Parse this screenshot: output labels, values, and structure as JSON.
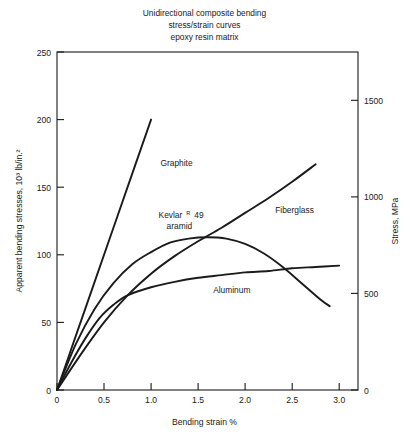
{
  "figure": {
    "title_lines": [
      "Unidirectional composite bending",
      "stress/strain curves",
      "epoxy resin matrix"
    ]
  },
  "chart_data": {
    "type": "line",
    "title": "Unidirectional composite bending stress/strain curves epoxy resin matrix",
    "xlabel": "Bending strain %",
    "ylabel": "Apparent bending stresses, 10³ lb/in.²",
    "ylabel_right": "Stress, MPa",
    "xlim": [
      0,
      3.2
    ],
    "ylim": [
      0,
      250
    ],
    "ylim_right": [
      0,
      1750
    ],
    "grid": false,
    "legend": "inline-annotations",
    "xticks": [
      0,
      0.5,
      1.0,
      1.5,
      2.0,
      2.5,
      3.0
    ],
    "xticklabels": [
      "0",
      "0.5",
      "1.0",
      "1.5",
      "2.0",
      "2.5",
      "3.0"
    ],
    "yticks": [
      0,
      50,
      100,
      150,
      200,
      250
    ],
    "yticklabels": [
      "0",
      "50",
      "100",
      "150",
      "200",
      "250"
    ],
    "yticks_right": [
      0,
      500,
      1000,
      1500
    ],
    "yticklabels_right": [
      "0",
      "500",
      "1000",
      "1500"
    ],
    "series": [
      {
        "name": "Graphite",
        "label": "Graphite",
        "label_x": 1.1,
        "label_y": 166,
        "points": [
          [
            0.0,
            0
          ],
          [
            0.2,
            40
          ],
          [
            0.4,
            80
          ],
          [
            0.6,
            120
          ],
          [
            0.8,
            160
          ],
          [
            1.0,
            200
          ]
        ]
      },
      {
        "name": "Fiberglass",
        "label": "Fiberglass",
        "label_x": 2.32,
        "label_y": 131,
        "points": [
          [
            0.0,
            0
          ],
          [
            0.25,
            26
          ],
          [
            0.5,
            50
          ],
          [
            0.75,
            70
          ],
          [
            1.0,
            86
          ],
          [
            1.25,
            99
          ],
          [
            1.5,
            110
          ],
          [
            1.75,
            120
          ],
          [
            2.0,
            131
          ],
          [
            2.25,
            142
          ],
          [
            2.5,
            154
          ],
          [
            2.75,
            167
          ]
        ]
      },
      {
        "name": "Kevlar R 49 aramid",
        "label": "Kevlar",
        "label_sup": "R",
        "label_num": "49",
        "label_line2": "aramid",
        "label_x": 1.08,
        "label_y": 127,
        "points": [
          [
            0.0,
            0
          ],
          [
            0.2,
            34
          ],
          [
            0.4,
            60
          ],
          [
            0.6,
            79
          ],
          [
            0.8,
            93
          ],
          [
            1.0,
            102
          ],
          [
            1.2,
            109
          ],
          [
            1.4,
            112
          ],
          [
            1.6,
            113
          ],
          [
            1.8,
            112
          ],
          [
            2.0,
            108
          ],
          [
            2.2,
            101
          ],
          [
            2.4,
            91
          ],
          [
            2.6,
            79
          ],
          [
            2.8,
            67
          ],
          [
            2.9,
            62
          ]
        ]
      },
      {
        "name": "Aluminum",
        "label": "Aluminum",
        "label_x": 1.66,
        "label_y": 72,
        "points": [
          [
            0.0,
            0
          ],
          [
            0.15,
            20
          ],
          [
            0.3,
            38
          ],
          [
            0.45,
            53
          ],
          [
            0.6,
            63
          ],
          [
            0.75,
            70
          ],
          [
            1.0,
            76
          ],
          [
            1.25,
            80
          ],
          [
            1.5,
            83
          ],
          [
            1.75,
            85
          ],
          [
            2.0,
            87
          ],
          [
            2.25,
            88
          ],
          [
            2.5,
            90
          ],
          [
            2.75,
            91
          ],
          [
            3.0,
            92
          ]
        ]
      }
    ]
  }
}
